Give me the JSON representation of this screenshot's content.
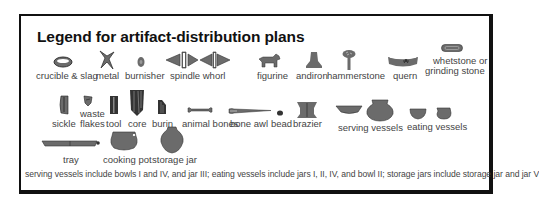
{
  "title": "Legend for artifact-distribution plans",
  "colors": {
    "icon_fill": "#6b6b6b",
    "icon_dark": "#333333",
    "label": "#444444",
    "border": "#111111"
  },
  "rows": [
    [
      {
        "icon": "crucible-icon",
        "label": "crucible & slag"
      },
      {
        "icon": "metal-icon",
        "label": "metal"
      },
      {
        "icon": "burnisher-icon",
        "label": "burnisher"
      },
      {
        "icon": "spindle-whorl-icon",
        "label": "spindle whorl"
      },
      {
        "icon": "figurine-icon",
        "label": "figurine"
      },
      {
        "icon": "andiron-icon",
        "label": "andiron"
      },
      {
        "icon": "hammerstone-icon",
        "label": "hammerstone"
      },
      {
        "icon": "quern-icon",
        "label": "quern"
      },
      {
        "icon": "whetstone-icon",
        "label": "whetstone or",
        "label2": "grinding stone"
      }
    ],
    [
      {
        "icon": "sickle-icon",
        "label": "sickle"
      },
      {
        "icon": "waste-flakes-icon",
        "label": "waste",
        "label2": "flakes"
      },
      {
        "icon": "tool-icon",
        "label": "tool"
      },
      {
        "icon": "core-icon",
        "label": "core"
      },
      {
        "icon": "burin-icon",
        "label": "burin"
      },
      {
        "icon": "animal-bones-icon",
        "label": "animal bones"
      },
      {
        "icon": "bone-awl-icon",
        "label": "bone awl"
      },
      {
        "icon": "bead-icon",
        "label": "bead"
      },
      {
        "icon": "brazier-icon",
        "label": "brazier"
      },
      {
        "icon": "serving-vessels-icon",
        "label": "serving vessels"
      },
      {
        "icon": "eating-vessels-icon",
        "label": "eating vessels"
      }
    ],
    [
      {
        "icon": "tray-icon",
        "label": "tray"
      },
      {
        "icon": "cooking-pot-icon",
        "label": "cooking pot"
      },
      {
        "icon": "storage-jar-icon",
        "label": "storage jar"
      }
    ]
  ],
  "footnote": "serving vessels include bowls I and IV, and jar III; eating vessels include jars I, II, IV, and bowl II; storage jars include storage jar and jar V"
}
